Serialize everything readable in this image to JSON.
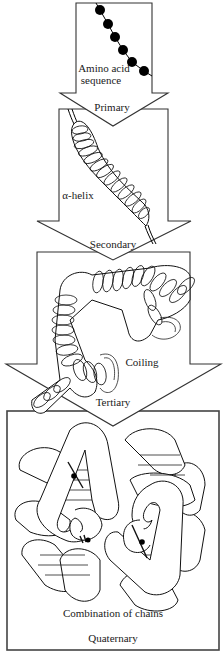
{
  "diagram": {
    "colors": {
      "outline": "#333333",
      "background": "#ffffff",
      "bead": "#000000",
      "text": "#1a1a1a"
    },
    "stages": [
      {
        "level": "Primary",
        "caption": [
          "Amino acid",
          "sequence"
        ],
        "icon": "amino-acid-bead-chain"
      },
      {
        "level": "Secondary",
        "caption": [
          "α-helix"
        ],
        "icon": "alpha-helix-coil"
      },
      {
        "level": "Tertiary",
        "caption": [
          "Coiling"
        ],
        "icon": "folded-helix-coil"
      },
      {
        "level": "Quaternary",
        "caption": [
          "Combination of chains"
        ],
        "icon": "multi-chain-complex"
      }
    ],
    "beads": [
      {
        "x": 100,
        "y": 10
      },
      {
        "x": 108,
        "y": 24
      },
      {
        "x": 115,
        "y": 37
      },
      {
        "x": 123,
        "y": 50
      },
      {
        "x": 132,
        "y": 62
      },
      {
        "x": 144,
        "y": 71
      }
    ]
  }
}
